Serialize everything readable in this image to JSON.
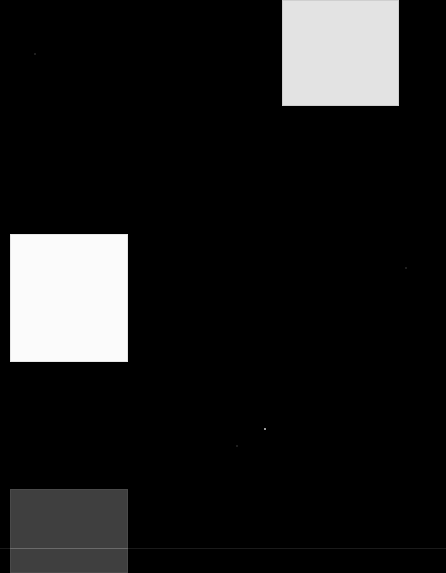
{
  "canvas": {
    "width": 446,
    "height": 573,
    "background": "#000000"
  },
  "tiles": [
    {
      "id": "top-right",
      "color": "#e3e3e3"
    },
    {
      "id": "middle-left",
      "color": "#fbfbfb"
    },
    {
      "id": "bottom-left",
      "color": "#3f3f3f"
    }
  ],
  "colors": {
    "background": "#000000",
    "divider": "#1a1a1a",
    "dot": "#cfcfcf"
  }
}
